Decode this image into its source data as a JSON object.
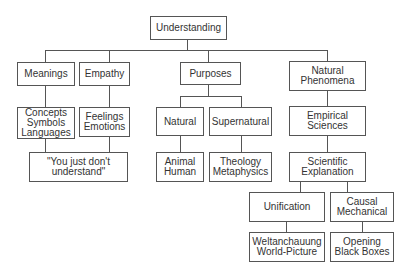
{
  "diagram": {
    "type": "hierarchy-tree",
    "root": "Understanding",
    "nodes": {
      "understanding": "Understanding",
      "meanings": "Meanings",
      "empathy": "Empathy",
      "purposes": "Purposes",
      "natural_phenomena": "Natural\nPhenomena",
      "concepts": "Concepts\nSymbols\nLanguages",
      "feelings": "Feelings\nEmotions",
      "natural": "Natural",
      "supernatural": "Supernatural",
      "empirical_sciences": "Empirical\nSciences",
      "you_just_dont_understand": "\"You just don't\nunderstand\"",
      "animal_human": "Animal\nHuman",
      "theology_metaphysics": "Theology\nMetaphysics",
      "scientific_explanation": "Scientific\nExplanation",
      "unification": "Unification",
      "causal_mechanical": "Causal\nMechanical",
      "weltanschauung": "Weltanchauung\nWorld-Picture",
      "opening_black_boxes": "Opening\nBlack Boxes"
    },
    "edges": [
      [
        "Understanding",
        "Meanings"
      ],
      [
        "Understanding",
        "Empathy"
      ],
      [
        "Understanding",
        "Purposes"
      ],
      [
        "Understanding",
        "Natural Phenomena"
      ],
      [
        "Meanings",
        "Concepts Symbols Languages"
      ],
      [
        "Empathy",
        "Feelings Emotions"
      ],
      [
        "Concepts Symbols Languages",
        "\"You just don't understand\""
      ],
      [
        "Feelings Emotions",
        "\"You just don't understand\""
      ],
      [
        "Purposes",
        "Natural"
      ],
      [
        "Purposes",
        "Supernatural"
      ],
      [
        "Natural",
        "Animal Human"
      ],
      [
        "Supernatural",
        "Theology Metaphysics"
      ],
      [
        "Natural Phenomena",
        "Empirical Sciences"
      ],
      [
        "Empirical Sciences",
        "Scientific Explanation"
      ],
      [
        "Scientific Explanation",
        "Unification"
      ],
      [
        "Scientific Explanation",
        "Causal Mechanical"
      ],
      [
        "Unification",
        "Weltanchauung World-Picture"
      ],
      [
        "Causal Mechanical",
        "Opening Black Boxes"
      ]
    ]
  }
}
